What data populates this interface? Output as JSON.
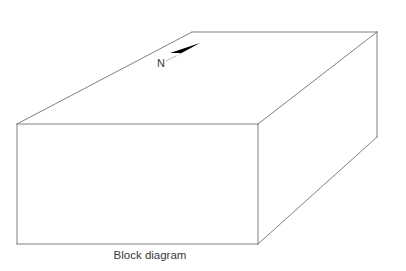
{
  "figure": {
    "caption": "Block diagram",
    "background_color": "#ffffff",
    "line_color": "#808080",
    "arrow_color": "#000000",
    "text_color": "#3a3a3a",
    "line_width": 1
  },
  "annotations": {
    "north_label": "N",
    "north_arrow_icon": "north-arrow-icon"
  },
  "geometry": {
    "type": "diagram",
    "shape": "rectangular-prism",
    "projection": "oblique-3d",
    "faces": [
      {
        "name": "front-face",
        "points": "17,124 258,124 258,244 17,244"
      },
      {
        "name": "top-face",
        "points": "17,124 192,32 377,32 258,124"
      },
      {
        "name": "right-face",
        "points": "258,124 377,32 377,137 258,244"
      }
    ],
    "edges": [
      {
        "name": "front-top-edge",
        "x1": 17,
        "y1": 124,
        "x2": 258,
        "y2": 124
      },
      {
        "name": "front-right-edge",
        "x1": 258,
        "y1": 124,
        "x2": 258,
        "y2": 244
      },
      {
        "name": "front-bottom-edge",
        "x1": 258,
        "y1": 244,
        "x2": 17,
        "y2": 244
      },
      {
        "name": "front-left-edge",
        "x1": 17,
        "y1": 244,
        "x2": 17,
        "y2": 124
      },
      {
        "name": "top-left-edge",
        "x1": 17,
        "y1": 124,
        "x2": 192,
        "y2": 32
      },
      {
        "name": "top-back-edge",
        "x1": 192,
        "y1": 32,
        "x2": 377,
        "y2": 32
      },
      {
        "name": "top-right-edge",
        "x1": 377,
        "y1": 32,
        "x2": 258,
        "y2": 124
      },
      {
        "name": "back-right-vertical-edge",
        "x1": 377,
        "y1": 32,
        "x2": 377,
        "y2": 137
      },
      {
        "name": "bottom-right-edge",
        "x1": 377,
        "y1": 137,
        "x2": 258,
        "y2": 244
      }
    ],
    "north_arrow": {
      "head_points": "200,43 170,53 181,53 176,56",
      "tail": {
        "x1": 176,
        "y1": 56,
        "x2": 166,
        "y2": 61
      },
      "label_x": 157,
      "label_y": 67
    },
    "caption_position": {
      "x": 150,
      "y": 259
    }
  }
}
